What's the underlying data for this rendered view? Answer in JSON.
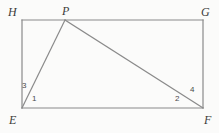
{
  "figure": {
    "type": "geometry-diagram",
    "background_color": "#fbfbfa",
    "stroke_color": "#8a8a8a",
    "label_color": "#3b3b3b",
    "points": {
      "H": {
        "label": "H",
        "x": 22,
        "y": 20
      },
      "G": {
        "label": "G",
        "x": 203,
        "y": 20
      },
      "E": {
        "label": "E",
        "x": 22,
        "y": 108
      },
      "F": {
        "label": "F",
        "x": 203,
        "y": 108
      },
      "P": {
        "label": "P",
        "x": 65,
        "y": 20
      }
    },
    "segments": [
      {
        "name": "HG",
        "from": "H",
        "to": "G"
      },
      {
        "name": "GF",
        "from": "G",
        "to": "F"
      },
      {
        "name": "FE",
        "from": "F",
        "to": "E"
      },
      {
        "name": "EH",
        "from": "E",
        "to": "H"
      },
      {
        "name": "PE",
        "from": "P",
        "to": "E"
      },
      {
        "name": "PF",
        "from": "P",
        "to": "F"
      }
    ],
    "angles": [
      {
        "label": "1",
        "vertex": "E",
        "position": "interior of triangle at E, right of PE"
      },
      {
        "label": "2",
        "vertex": "F",
        "position": "interior of triangle at F, left of PF"
      },
      {
        "label": "3",
        "vertex": "E",
        "position": "between side EH and segment PE"
      },
      {
        "label": "4",
        "vertex": "F",
        "position": "between segment PF and side FG"
      }
    ]
  }
}
